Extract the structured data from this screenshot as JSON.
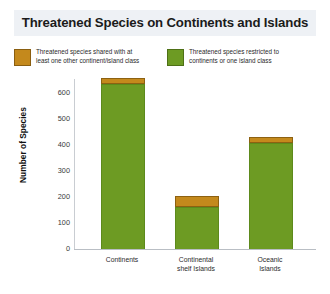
{
  "chart_data": {
    "type": "bar",
    "stacked": true,
    "title": "Threatened Species on Continents and Islands",
    "xlabel": "",
    "ylabel": "Number of Species",
    "ylim": [
      0,
      650
    ],
    "yticks": [
      0,
      100,
      200,
      300,
      400,
      500,
      600
    ],
    "ytick_labels": [
      "0",
      "100",
      "200",
      "300",
      "400",
      "500",
      "600"
    ],
    "grid": true,
    "legend_position": "top",
    "categories": [
      "Continents",
      "Continental shelf Islands",
      "Oceanic Islands"
    ],
    "category_lines": [
      [
        "Continents",
        ""
      ],
      [
        "Continental",
        "shelf Islands"
      ],
      [
        "Oceanic",
        "Islands"
      ]
    ],
    "series": [
      {
        "name": "Threatened species restricted to continents or one island class",
        "color": "#6d9b23",
        "values": [
          630,
          162,
          408
        ]
      },
      {
        "name": "Threatened species shared with at least one other continent/island class",
        "color": "#c4891c",
        "values": [
          24,
          42,
          23
        ]
      }
    ],
    "totals": [
      654,
      204,
      431
    ]
  },
  "title": {
    "text": "Threatened Species on Continents and Islands",
    "band_color": "#eef1f5"
  },
  "legend": {
    "entries": [
      {
        "swatch": "orange",
        "color": "#c4891c",
        "line1": "Threatened species shared with at",
        "line2": "least one other continent/island class"
      },
      {
        "swatch": "green",
        "color": "#6d9b23",
        "line1": "Threatened species restricted to",
        "line2": "continents or one island class"
      }
    ]
  },
  "yaxis": {
    "label": "Number of Species",
    "ticks": [
      "600",
      "500",
      "400",
      "300",
      "200",
      "100",
      "0"
    ]
  },
  "xaxis": {
    "ticks": [
      {
        "line1": "Continents",
        "line2": ""
      },
      {
        "line1": "Continental",
        "line2": "shelf Islands"
      },
      {
        "line1": "Oceanic",
        "line2": "Islands"
      }
    ]
  }
}
